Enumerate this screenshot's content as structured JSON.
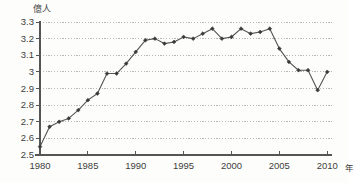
{
  "chart_data": {
    "type": "line",
    "title": "",
    "subtitle": "",
    "xlabel": "年",
    "ylabel": "億人",
    "unit_label": "億人",
    "xaxis_unit_suffix": "年",
    "xlim": [
      1980,
      2010.5
    ],
    "ylim": [
      2.5,
      3.3
    ],
    "grid": true,
    "grid_style": "dotted-horizontal",
    "legend": null,
    "legend_position": "none",
    "marker": "filled-diamond",
    "line_color": "#555555",
    "marker_color": "#3a3a3a",
    "grid_color": "#9a9a9a",
    "axis_color": "#555555",
    "x_tick_labels": [
      "1980",
      "1985",
      "1990",
      "1995",
      "2000",
      "2005",
      "2010"
    ],
    "x_tick_values": [
      1980,
      1985,
      1990,
      1995,
      2000,
      2005,
      2010
    ],
    "y_tick_labels": [
      "3.3",
      "3.2",
      "3.1",
      "3",
      "2.9",
      "2.8",
      "2.7",
      "2.6",
      "2.5"
    ],
    "y_tick_values": [
      3.3,
      3.2,
      3.1,
      3.0,
      2.9,
      2.8,
      2.7,
      2.6,
      2.5
    ],
    "x": [
      1980,
      1981,
      1982,
      1983,
      1984,
      1985,
      1986,
      1987,
      1988,
      1989,
      1990,
      1991,
      1992,
      1993,
      1994,
      1995,
      1996,
      1997,
      1998,
      1999,
      2000,
      2001,
      2002,
      2003,
      2004,
      2005,
      2006,
      2007,
      2008,
      2009,
      2010
    ],
    "values": [
      2.55,
      2.67,
      2.7,
      2.72,
      2.77,
      2.83,
      2.87,
      2.99,
      2.99,
      3.05,
      3.12,
      3.19,
      3.2,
      3.17,
      3.18,
      3.21,
      3.2,
      3.23,
      3.26,
      3.2,
      3.21,
      3.26,
      3.23,
      3.24,
      3.26,
      3.14,
      3.06,
      3.01,
      3.01,
      2.89,
      3.0
    ]
  }
}
